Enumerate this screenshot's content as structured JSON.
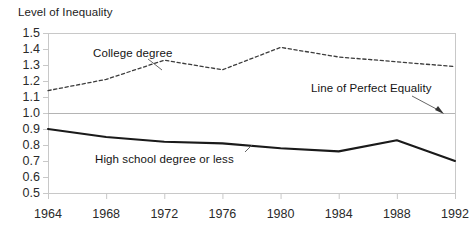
{
  "chart_data": {
    "type": "line",
    "title": "",
    "ylabel": "Level of Inequality",
    "xlabel": "",
    "categories": [
      "1964",
      "1968",
      "1972",
      "1976",
      "1980",
      "1984",
      "1988",
      "1992"
    ],
    "x": [
      1964,
      1968,
      1972,
      1976,
      1980,
      1984,
      1988,
      1992
    ],
    "ylim": [
      0.5,
      1.5
    ],
    "xlim": [
      1964,
      1992
    ],
    "yticks": [
      "1.5",
      "1.4",
      "1.3",
      "1.2",
      "1.1",
      "1.0",
      "0.9",
      "0.8",
      "0.7",
      "0.6",
      "0.5"
    ],
    "ytick_values": [
      1.5,
      1.4,
      1.3,
      1.2,
      1.1,
      1.0,
      0.9,
      0.8,
      0.7,
      0.6,
      0.5
    ],
    "grid": false,
    "legend": "none",
    "reference_line": {
      "value": 1.0,
      "label": "Line of Perfect Equality",
      "color": "#b4b4b4"
    },
    "series": [
      {
        "name": "College degree",
        "style": "dashed",
        "color": "#3c3c3c",
        "values": [
          1.14,
          1.21,
          1.33,
          1.27,
          1.41,
          1.35,
          1.32,
          1.29
        ]
      },
      {
        "name": "High school degree or less",
        "style": "solid",
        "color": "#1a1a1a",
        "values": [
          0.9,
          0.85,
          0.82,
          0.81,
          0.78,
          0.76,
          0.83,
          0.7
        ]
      }
    ],
    "annotations": [
      {
        "id": "college-degree",
        "text": "College degree",
        "has_leader_line": true
      },
      {
        "id": "high-school",
        "text": "High school degree or less",
        "has_leader_line": true
      },
      {
        "id": "perfect-equality",
        "text": "Line of Perfect Equality",
        "has_leader_line": true,
        "has_arrow": true
      }
    ]
  },
  "colors": {
    "background": "#ffffff",
    "plot_border": "#c8c8c8",
    "axis_text": "#2a2a2a",
    "reference_line": "#b4b4b4",
    "solid_series": "#1a1a1a",
    "dashed_series": "#3c3c3c"
  },
  "axis": {
    "ylabel": "Level of Inequality"
  }
}
